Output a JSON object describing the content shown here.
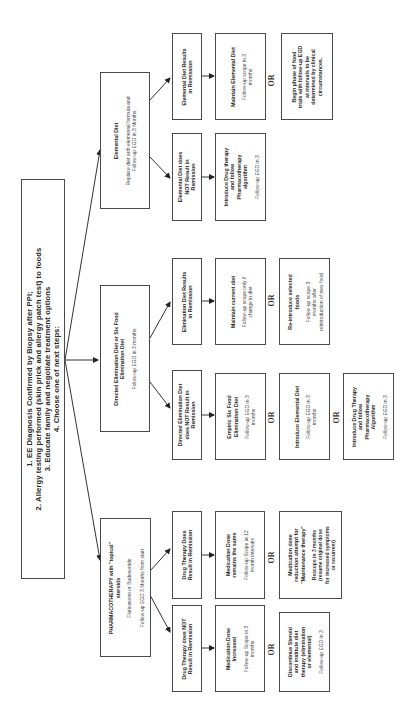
{
  "root": {
    "lines": "1.  EE Diagnosis Confirmed by Biopsy after PPI;\n2.  Allergy testing performed (skin prick and allergy patch test)  to foods\n3.  Educate family and negotiate treatment options\n4.  Choose one of next steps:"
  },
  "branches": [
    {
      "title": "Elemental Diet",
      "sub": "Replace diet with elemental formula and\nFollow-up EGD in 3 Months",
      "remission": {
        "title": "Elemental Diet Results\nin Remission",
        "options": [
          {
            "title": "Maintain Elemental Diet",
            "sub": "Follow-up scope in 3\nmonths"
          },
          {
            "title": "",
            "sub": "Begin phase of food\ntrials with follow-up EGD\nat intervals to be\ndetermined by clinical\ncircumstances."
          }
        ]
      },
      "no_remission": {
        "title": "Elemental Diet does\nNOT Result in\nRemission",
        "options": [
          {
            "title": "Introduce Drug therapy\nand follow\nPharmacotherapy\nalgorithm",
            "sub": "Follow-up EGD in 3"
          }
        ]
      }
    },
    {
      "title": "Directed Elimination Diet or Six Food\nElimination Diet",
      "sub": "Follow-up EGD in 3 months",
      "remission": {
        "title": "Elimination Diet Results\nin Remission",
        "options": [
          {
            "title": "Maintain current diet",
            "sub": "Follow-up scope only if\nchange in diet"
          },
          {
            "title": "Re-introduce selected\nfoods",
            "sub": "Follow-up scope 3\nmonths after\nreintroduction of new food"
          }
        ]
      },
      "no_remission": {
        "title": "Directed Elimination Diet\ndoes NOT Result in\nRemission",
        "options": [
          {
            "title": "Empiric Six Food\nElimination Diet",
            "sub": "Follow-up EGD in 3\nmonths"
          },
          {
            "title": "Introduce Elemental Diet",
            "sub": "Follow-up EGD in 3\nmonths"
          },
          {
            "title": "Introduce Drug Therapy\nand follow\nPharmacotherapy\nAlgorithm",
            "sub": "Follow-up EGD in 3"
          }
        ]
      }
    },
    {
      "title": "PHARMACOTHERAPY with \"topical\"\nsteroids",
      "sub": "Fluticasone or Budesonide\n\nFollow-up EGD 3 Months from start",
      "remission": {
        "title": "Drug Therapy Does\nResult in Remission",
        "options": [
          {
            "title": "Medication Dose\nremains the same",
            "sub": "Follow-up Scope at 12\nmonth intervals"
          },
          {
            "title": "Medication dose\nreduction attempt for\n\"Maintenance therapy\"",
            "sub": "Rescope in 3 months\n(resume original dose\nfor increased symptoms\nor recurrent)"
          }
        ]
      },
      "no_remission": {
        "title": "Drug Therapy does NOT\nResult in Remission",
        "options": [
          {
            "title": "Medication Dose\nIncreased",
            "sub": "Follow-up Scope in 3\nmonths"
          },
          {
            "title": "Discontinue Steroid\nand institute diet\ntherapy (elimination\nor elemental)",
            "sub": "Follow-up EGD in 3"
          }
        ]
      }
    }
  ],
  "or_label": "OR"
}
